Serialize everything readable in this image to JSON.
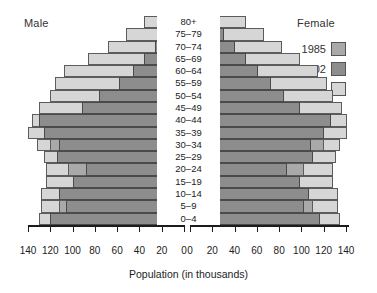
{
  "chart_data": {
    "type": "bar",
    "subtype": "population-pyramid",
    "title": "",
    "xlabel": "Population (in thousands)",
    "ylabel": "",
    "left_panel_label": "Male",
    "right_panel_label": "Female",
    "legend_title": "Female",
    "legend_position": "top-right",
    "grid": false,
    "xlim": [
      0,
      140
    ],
    "xticks": [
      0,
      20,
      40,
      60,
      80,
      100,
      120,
      140
    ],
    "left_xticks": [
      140,
      120,
      100,
      80,
      60,
      40,
      20,
      0
    ],
    "right_xticks": [
      0,
      20,
      40,
      60,
      80,
      100,
      120,
      140
    ],
    "categories": [
      "80+",
      "75–79",
      "70–74",
      "65–69",
      "60–64",
      "55–59",
      "50–54",
      "45–49",
      "40–44",
      "35–39",
      "30–34",
      "25–29",
      "20–24",
      "15–19",
      "10–14",
      "5–9",
      "0–4"
    ],
    "series": [
      {
        "name": "1985",
        "color": "#a9a9a9",
        "male": [
          8,
          14,
          22,
          30,
          40,
          52,
          62,
          74,
          86,
          108,
          120,
          112,
          104,
          96,
          108,
          112,
          118
        ],
        "female": [
          14,
          22,
          32,
          42,
          52,
          62,
          70,
          80,
          92,
          110,
          118,
          108,
          100,
          94,
          104,
          108,
          112
        ]
      },
      {
        "name": "2002",
        "color": "#8d8d8d",
        "male": [
          12,
          18,
          26,
          36,
          46,
          58,
          76,
          92,
          130,
          126,
          112,
          114,
          88,
          100,
          112,
          106,
          120
        ],
        "female": [
          20,
          28,
          38,
          48,
          58,
          70,
          82,
          96,
          124,
          118,
          106,
          108,
          84,
          96,
          104,
          100,
          114
        ]
      },
      {
        "name": "2025",
        "color": "#d6d6d6",
        "male": [
          36,
          52,
          68,
          86,
          108,
          116,
          120,
          130,
          136,
          140,
          132,
          126,
          124,
          124,
          128,
          128,
          130
        ],
        "female": [
          48,
          64,
          80,
          96,
          112,
          120,
          126,
          134,
          138,
          138,
          132,
          128,
          126,
          126,
          130,
          130,
          132
        ]
      }
    ]
  },
  "legend": {
    "title": "Female",
    "entries": [
      {
        "label": "1985",
        "color": "#a9a9a9"
      },
      {
        "label": "2002",
        "color": "#8d8d8d"
      },
      {
        "label": "2025",
        "color": "#d6d6d6"
      }
    ]
  },
  "axis": {
    "xlabel": "Population (in thousands)",
    "left_ticks": [
      "140",
      "120",
      "100",
      "80",
      "60",
      "40",
      "20",
      "0"
    ],
    "right_ticks": [
      "0",
      "20",
      "40",
      "60",
      "80",
      "100",
      "120",
      "140"
    ]
  },
  "captions": {
    "male": "Male",
    "female": "Female"
  }
}
